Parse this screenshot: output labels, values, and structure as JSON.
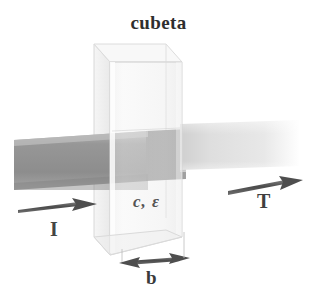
{
  "figure": {
    "title": "cubeta",
    "background_color": "#ffffff",
    "width": 317,
    "height": 304
  },
  "labels": {
    "title": "cubeta",
    "incident_beam": "I",
    "transmitted_beam": "T",
    "path_length": "b",
    "sample_properties": "c, ε"
  },
  "colors": {
    "incident_beam": "#9a9a9a",
    "beam_in_cell": "#8e8e8e",
    "transmitted_beam": "#e3e3e3",
    "cuvette_glass": "#efefef",
    "cuvette_edge": "#d2d2d2",
    "arrow": "#5a5a5a",
    "text": "#3b3b3b"
  },
  "diagram": {
    "type": "spectrophotometry-cuvette",
    "cuvette": {
      "front_face": {
        "x": 110,
        "y": 62,
        "width": 72,
        "height": 193
      },
      "depth_offset_x": -16,
      "depth_offset_y": -18,
      "opacity": 0.55
    },
    "incident_beam": {
      "start_x": 14,
      "end_x": 186,
      "top_y": 131,
      "height": 50,
      "direction": "left-to-right",
      "intensity": "high"
    },
    "transmitted_beam": {
      "start_x": 182,
      "end_x": 300,
      "top_y": 121,
      "height": 46,
      "direction": "left-to-right",
      "intensity": "low"
    },
    "arrows": [
      {
        "name": "incident-arrow",
        "x1": 18,
        "y1": 210,
        "x2": 96,
        "y2": 204,
        "heads": "end"
      },
      {
        "name": "transmitted-arrow",
        "x1": 228,
        "y1": 190,
        "x2": 300,
        "y2": 180,
        "heads": "end"
      },
      {
        "name": "path-length-arrow",
        "x1": 122,
        "y1": 262,
        "x2": 188,
        "y2": 258,
        "heads": "both"
      }
    ]
  }
}
